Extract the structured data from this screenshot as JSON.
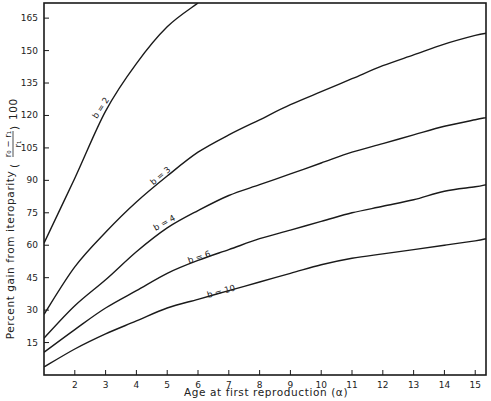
{
  "chart_data": {
    "type": "line",
    "title": "",
    "xlabel": "Age at first reproduction (α)",
    "ylabel": "Percent gain from iteroparity",
    "ylabel_formula": "((r₀ − r₁)/r₁) 100",
    "xlim": [
      1,
      15.35
    ],
    "ylim": [
      0,
      172
    ],
    "x_ticks": [
      2,
      3,
      4,
      5,
      6,
      7,
      8,
      9,
      10,
      11,
      12,
      13,
      14,
      15
    ],
    "y_ticks": [
      15,
      30,
      45,
      60,
      75,
      90,
      105,
      120,
      135,
      150,
      165
    ],
    "grid": false,
    "legend": "inline curve labels",
    "x": [
      1,
      2,
      3,
      4,
      5,
      6,
      7,
      8,
      9,
      10,
      11,
      12,
      13,
      14,
      15,
      15.35
    ],
    "series": [
      {
        "name": "b = 2",
        "label_at": [
          3.0,
          122
        ],
        "values": [
          61,
          91,
          122,
          144,
          161,
          172,
          null,
          null,
          null,
          null,
          null,
          null,
          null,
          null,
          null,
          null
        ]
      },
      {
        "name": "b = 3",
        "label_at": [
          4.9,
          90
        ],
        "values": [
          28,
          50,
          66,
          80,
          92,
          103,
          111,
          118,
          125,
          131,
          137,
          143,
          148,
          153,
          157,
          158
        ]
      },
      {
        "name": "b = 4",
        "label_at": [
          5.0,
          68
        ],
        "values": [
          17,
          32,
          44,
          57,
          68,
          76,
          83,
          88,
          93,
          98,
          103,
          107,
          111,
          115,
          118,
          119
        ]
      },
      {
        "name": "b = 6",
        "label_at": [
          6.1,
          52
        ],
        "values": [
          10.5,
          21,
          31,
          39,
          47,
          53,
          58,
          63,
          67,
          71,
          75,
          78,
          81,
          85,
          87,
          88
        ]
      },
      {
        "name": "b = 10",
        "label_at": [
          6.8,
          36
        ],
        "values": [
          3.7,
          12,
          19,
          25,
          31,
          35,
          39,
          43,
          47,
          51,
          54,
          56,
          58,
          60,
          62,
          63
        ]
      }
    ]
  },
  "labels": {
    "xlabel": "Age at first reproduction (α)",
    "ylabel_prefix": "Percent gain from iteroparity",
    "ylabel_num": "r₀ − r₁",
    "ylabel_den": "r₁",
    "ylabel_suffix": "100"
  }
}
